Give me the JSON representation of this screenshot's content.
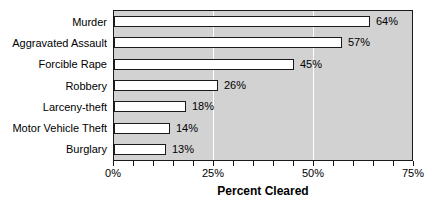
{
  "chart_data": {
    "type": "bar",
    "orientation": "horizontal",
    "title": "",
    "xlabel": "Percent Cleared",
    "ylabel": "",
    "categories": [
      "Murder",
      "Aggravated Assault",
      "Forcible Rape",
      "Robbery",
      "Larceny-theft",
      "Motor Vehicle Theft",
      "Burglary"
    ],
    "values": [
      64,
      57,
      45,
      26,
      18,
      14,
      13
    ],
    "value_labels": [
      "64%",
      "57%",
      "45%",
      "26%",
      "18%",
      "14%",
      "13%"
    ],
    "xlim": [
      0,
      75
    ],
    "x_major_ticks": [
      0,
      25,
      50,
      75
    ],
    "x_major_tick_labels": [
      "0%",
      "25%",
      "50%",
      "75%"
    ],
    "x_minor_tick_interval": 5,
    "grid": "vertical-major",
    "gridline_positions": [
      25,
      50
    ],
    "legend": "none",
    "colors": {
      "page_background": "#ffffff",
      "plot_background": "#d2d2d2",
      "bar_fill": "#ffffff",
      "bar_border": "#1a1a1a",
      "frame_border": "#1a1a1a",
      "gridline": "#ffffff",
      "text": "#000000"
    }
  }
}
